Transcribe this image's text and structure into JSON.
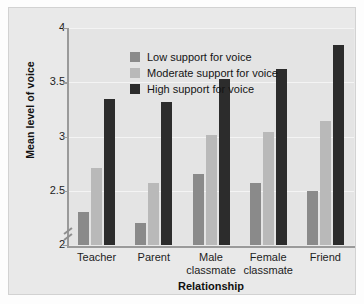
{
  "chart_data": {
    "type": "bar",
    "title": "",
    "subtitle": "",
    "xlabel": "Relationship",
    "ylabel": "Mean level of voice",
    "categories": [
      "Teacher",
      "Parent",
      "Male classmate",
      "Female classmate",
      "Friend"
    ],
    "category_lines": [
      [
        "Teacher"
      ],
      [
        "Parent"
      ],
      [
        "Male",
        "classmate"
      ],
      [
        "Female",
        "classmate"
      ],
      [
        "Friend"
      ]
    ],
    "series": [
      {
        "name": "Low support for voice",
        "color": "#8a8a8a",
        "values": [
          2.3,
          2.2,
          2.65,
          2.57,
          2.5
        ]
      },
      {
        "name": "Moderate support for voice",
        "color": "#b9b9b9",
        "values": [
          2.71,
          2.57,
          3.01,
          3.04,
          3.14
        ]
      },
      {
        "name": "High support for voice",
        "color": "#2c2c2c",
        "values": [
          3.35,
          3.32,
          3.53,
          3.62,
          3.84
        ]
      }
    ],
    "ylim": [
      2.0,
      4.0
    ],
    "yticks": [
      2,
      2.5,
      3,
      3.5,
      4
    ],
    "ytick_labels": [
      "2",
      "2.5",
      "3",
      "3.5",
      "4"
    ],
    "axis_break": true,
    "axis_break_note": "y-axis broken below 2",
    "grid": true,
    "grid_color": "#f4f4f4",
    "legend_position": "top-left inside plot",
    "panel_background": "#e4e4e4",
    "axis_color": "#9a9a9a"
  }
}
